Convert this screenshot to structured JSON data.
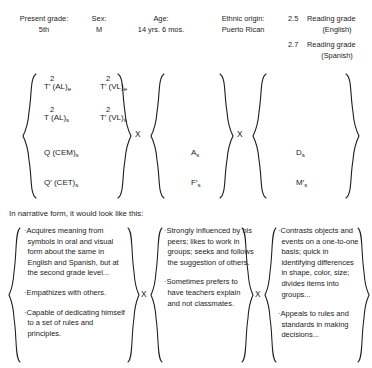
{
  "header": {
    "fields": [
      {
        "label": "Present grade:",
        "value": "5th"
      },
      {
        "label": "Sex:",
        "value": "M"
      },
      {
        "label": "Age:",
        "value": "14 yrs. 6 mos."
      },
      {
        "label": "Ethnic origin:",
        "value": "Puerto Rican"
      }
    ],
    "reading": [
      {
        "score": "2.5",
        "text": "Reading grade",
        "language": "(English)"
      },
      {
        "score": "2.7",
        "text": "Reading grade",
        "language": "(Spanish)"
      }
    ]
  },
  "formula": {
    "operator": "X",
    "group1": {
      "rows": [
        {
          "left": {
            "base": "T′ (AL)",
            "sup": "2",
            "sub": "e"
          },
          "right": {
            "base": "T′ (VL)",
            "sup": "2",
            "sub": "e"
          }
        },
        {
          "left": {
            "base": "T (AL)",
            "sup": "2",
            "sub": "s"
          },
          "right": {
            "base": "T′ (VL)",
            "sup": "2",
            "sub": "s"
          }
        },
        {
          "left": {
            "base": "Q (CEM)",
            "sup": "",
            "sub": "s"
          },
          "right": null
        },
        {
          "left": {
            "base": "Q′ (CET)",
            "sup": "",
            "sub": "s"
          },
          "right": null
        }
      ]
    },
    "group2": {
      "rows": [
        {
          "base": "A",
          "sub": "s"
        },
        {
          "base": "F′",
          "sub": "s"
        }
      ]
    },
    "group3": {
      "rows": [
        {
          "base": "D",
          "sub": "s"
        },
        {
          "base": "M′",
          "sub": "s"
        }
      ]
    }
  },
  "narrative": {
    "intro": "In narrative form, it would look like this:",
    "operator": "X",
    "columns": [
      {
        "items": [
          "·Acquires meaning from symbols in oral and visual form about the same in English and Spanish, but at the second grade level...",
          "·Empathizes with others.",
          "·Capable of dedicating himself to a set of rules and principles."
        ]
      },
      {
        "items": [
          "·Strongly influenced by his peers; likes to work in groups; seeks and follows the suggestion of others.",
          "·Sometimes prefers to have teachers explain and not classmates."
        ]
      },
      {
        "items": [
          "·Contrasts objects and events on a one-to-one basis; quick in identifying differences in shape, color, size; divides items into groups...",
          "·Appeals to rules and standards in making decisions..."
        ]
      }
    ]
  },
  "colors": {
    "ink": "#1c1c1c",
    "paper": "#ffffff"
  }
}
